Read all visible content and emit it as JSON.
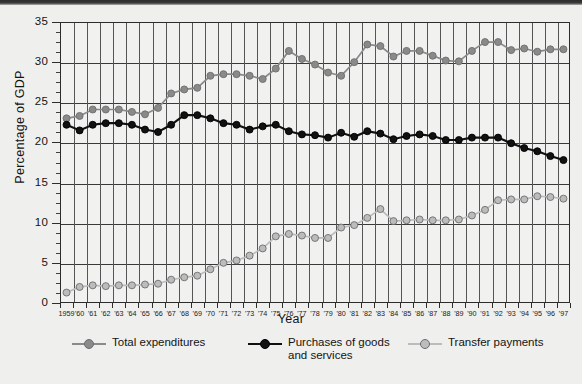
{
  "chart_data": {
    "type": "line",
    "title": "",
    "xlabel": "Year",
    "ylabel": "Percentage of GDP",
    "ylim": [
      0,
      35
    ],
    "ytick_step": 5,
    "yticks": [
      0,
      5,
      10,
      15,
      20,
      25,
      30,
      35
    ],
    "ytick_labels": [
      "0",
      "5",
      "10",
      "15",
      "20",
      "25",
      "30",
      "35"
    ],
    "minor_ytick_step": 1.25,
    "grid": "both",
    "legend_position": "bottom",
    "x": [
      1959,
      1960,
      1961,
      1962,
      1963,
      1964,
      1965,
      1966,
      1967,
      1968,
      1969,
      1970,
      1971,
      1972,
      1973,
      1974,
      1975,
      1976,
      1977,
      1978,
      1979,
      1980,
      1981,
      1982,
      1983,
      1984,
      1985,
      1986,
      1987,
      1988,
      1989,
      1990,
      1991,
      1992,
      1993,
      1994,
      1995,
      1996,
      1997
    ],
    "xtick_labels": [
      "1959",
      "'60",
      "'61",
      "'62",
      "'63",
      "'64",
      "'65",
      "'66",
      "'67",
      "'68",
      "'69",
      "'70",
      "'71",
      "'72",
      "'73",
      "'74",
      "'75",
      "'76",
      "'77",
      "'78",
      "'79",
      "'80",
      "'81",
      "'82",
      "'83",
      "'84",
      "'85",
      "'86",
      "'87",
      "'88",
      "'89",
      "'90",
      "'91",
      "'92",
      "'93",
      "'94",
      "'95",
      "'96",
      "'97"
    ],
    "series": [
      {
        "name": "Total expenditures",
        "color": "#8a8a8a",
        "marker_color": "#8a8a8a",
        "values": [
          23.0,
          23.3,
          24.1,
          24.1,
          24.1,
          23.8,
          23.5,
          24.3,
          26.1,
          26.6,
          26.8,
          28.3,
          28.5,
          28.5,
          28.3,
          27.9,
          29.2,
          31.4,
          30.4,
          29.7,
          28.7,
          28.3,
          30.0,
          32.2,
          32.0,
          30.7,
          31.4,
          31.4,
          30.8,
          30.2,
          30.1,
          31.4,
          32.5,
          32.5,
          31.5,
          31.7,
          31.3,
          31.6,
          31.6
        ]
      },
      {
        "name": "Purchases of goods\nand services",
        "color": "#111111",
        "marker_color": "#111111",
        "values": [
          22.2,
          21.5,
          22.2,
          22.4,
          22.4,
          22.2,
          21.6,
          21.3,
          22.2,
          23.4,
          23.4,
          23.0,
          22.4,
          22.2,
          21.6,
          22.0,
          22.2,
          21.4,
          21.0,
          20.9,
          20.6,
          21.2,
          20.7,
          21.4,
          21.1,
          20.4,
          20.8,
          21.0,
          20.8,
          20.3,
          20.3,
          20.6,
          20.6,
          20.6,
          19.9,
          19.3,
          18.9,
          18.3,
          17.8
        ]
      },
      {
        "name": "Transfer payments",
        "color": "#bcbcbc",
        "marker_color": "#bcbcbc",
        "values": [
          1.3,
          2.0,
          2.2,
          2.1,
          2.2,
          2.2,
          2.3,
          2.4,
          2.9,
          3.2,
          3.4,
          4.2,
          5.0,
          5.3,
          5.9,
          6.8,
          8.3,
          8.6,
          8.4,
          8.1,
          8.1,
          9.4,
          9.7,
          10.6,
          11.7,
          10.2,
          10.3,
          10.4,
          10.3,
          10.3,
          10.4,
          10.9,
          11.6,
          12.8,
          12.9,
          12.9,
          13.3,
          13.2,
          13.0
        ]
      }
    ]
  },
  "legend": {
    "items": [
      {
        "label": "Total expenditures",
        "key": "total-expenditures"
      },
      {
        "label": "Purchases of goods\nand services",
        "key": "purchases-goods-services"
      },
      {
        "label": "Transfer payments",
        "key": "transfer-payments"
      }
    ]
  }
}
